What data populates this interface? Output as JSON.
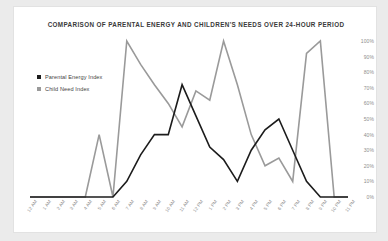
{
  "card": {
    "title": "COMPARISON OF PARENTAL ENERGY AND CHILDREN'S NEEDS OVER 24-HOUR PERIOD",
    "background_color": "#ffffff",
    "page_background_color": "#ebebeb"
  },
  "legend": {
    "position": "top-left-inside",
    "items": [
      {
        "label": "Parental Energy Index",
        "color": "#1c1c1c",
        "marker": "square-marker"
      },
      {
        "label": "Child Need Index",
        "color": "#9a9a9a",
        "marker": "square-marker"
      }
    ]
  },
  "chart_data": {
    "type": "line",
    "title": "COMPARISON OF PARENTAL ENERGY AND CHILDREN'S NEEDS OVER 24-HOUR PERIOD",
    "xlabel": "",
    "ylabel": "",
    "grid": false,
    "ylim": [
      0,
      100
    ],
    "y_tick_labels": [
      "100%",
      "90%",
      "80%",
      "70%",
      "60%",
      "50%",
      "40%",
      "30%",
      "20%",
      "10%",
      "0%"
    ],
    "y_tick_values": [
      100,
      90,
      80,
      70,
      60,
      50,
      40,
      30,
      20,
      10,
      0
    ],
    "y_axis_position": "right",
    "categories": [
      "12 AM",
      "1 AM",
      "2 AM",
      "3 AM",
      "4 AM",
      "5 AM",
      "6 AM",
      "7 AM",
      "8 AM",
      "9 AM",
      "10 AM",
      "11 AM",
      "12 PM",
      "1 PM",
      "2 PM",
      "3 PM",
      "4 PM",
      "5 PM",
      "6 PM",
      "7 PM",
      "8 PM",
      "9 PM",
      "10 PM",
      "11 PM"
    ],
    "series": [
      {
        "name": "Parental Energy Index",
        "color": "#1c1c1c",
        "values": [
          0,
          0,
          0,
          0,
          0,
          0,
          0,
          10,
          27,
          40,
          40,
          72,
          52,
          32,
          24,
          10,
          30,
          43,
          50,
          30,
          10,
          0,
          0,
          0
        ]
      },
      {
        "name": "Child Need Index",
        "color": "#9a9a9a",
        "values": [
          0,
          0,
          0,
          0,
          0,
          40,
          0,
          100,
          85,
          72,
          60,
          45,
          68,
          62,
          100,
          72,
          40,
          20,
          25,
          10,
          92,
          100,
          0,
          0
        ]
      }
    ]
  }
}
